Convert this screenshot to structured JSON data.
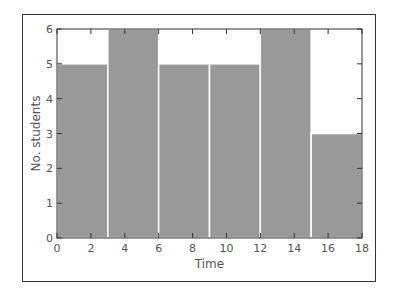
{
  "chart_data": {
    "type": "bar",
    "title": "",
    "xlabel": "Time",
    "ylabel": "No. students",
    "bins": [
      [
        0,
        3
      ],
      [
        3,
        6
      ],
      [
        6,
        9
      ],
      [
        9,
        12
      ],
      [
        12,
        15
      ],
      [
        15,
        18
      ]
    ],
    "categories": [
      "0-3",
      "3-6",
      "6-9",
      "9-12",
      "12-15",
      "15-18"
    ],
    "values": [
      5,
      6,
      5,
      5,
      6,
      3
    ],
    "xlim": [
      0,
      18
    ],
    "ylim": [
      0,
      6
    ],
    "xticks": [
      0,
      2,
      4,
      6,
      8,
      10,
      12,
      14,
      16,
      18
    ],
    "yticks": [
      0,
      1,
      2,
      3,
      4,
      5,
      6
    ],
    "grid": false,
    "legend": null,
    "bar_color": "#999999",
    "edge_color": "#ffffff"
  }
}
